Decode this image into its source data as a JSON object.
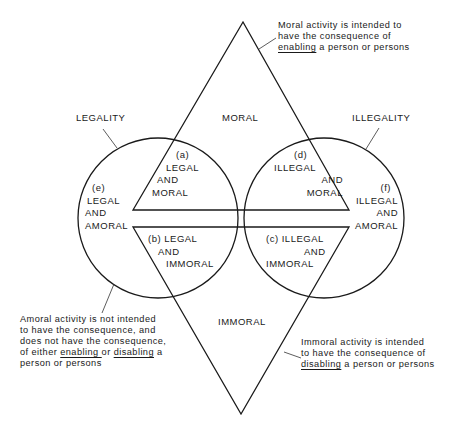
{
  "diagram": {
    "region_labels": {
      "moral": "MORAL",
      "immoral": "IMMORAL",
      "legality": "LEGALITY",
      "illegality": "ILLEGALITY"
    },
    "regions": {
      "a": {
        "tag": "(a)",
        "line1": "LEGAL",
        "line2": "AND",
        "line3": "MORAL"
      },
      "b": {
        "tag": "(b)",
        "line1": "LEGAL",
        "line2": "AND",
        "line3": "IMMORAL"
      },
      "c": {
        "tag": "(c)",
        "line1": "ILLEGAL",
        "line2": "AND",
        "line3": "IMMORAL"
      },
      "d": {
        "tag": "(d)",
        "line1": "ILLEGAL",
        "line2": "AND",
        "line3": "MORAL"
      },
      "e": {
        "tag": "(e)",
        "line1": "LEGAL",
        "line2": "AND",
        "line3": "AMORAL"
      },
      "f": {
        "tag": "(f)",
        "line1": "ILLEGAL",
        "line2": "AND",
        "line3": "AMORAL"
      }
    },
    "notes": {
      "moral": {
        "line1": "Moral activity is intended to",
        "line2": "have the consequence of",
        "line3_u": "enabling",
        "line3_rest": " a person or persons"
      },
      "amoral": {
        "line1": "Amoral activity is not intended",
        "line2": "to have the consequence, and",
        "line3": "does not have the consequence,",
        "line4_pre": "of either ",
        "line4_u1": "enabling",
        "line4_mid": " or ",
        "line4_u2": "disabling",
        "line4_post": " a",
        "line5_pre": "person or ",
        "line5_o": "persons"
      },
      "immoral": {
        "line1": "Immoral activity is intended",
        "line2": "to have the consequence of",
        "line3_u": "disabling",
        "line3_rest": " a person or persons"
      }
    },
    "colors": {
      "line": "#1a1a1a",
      "background": "#ffffff"
    }
  }
}
